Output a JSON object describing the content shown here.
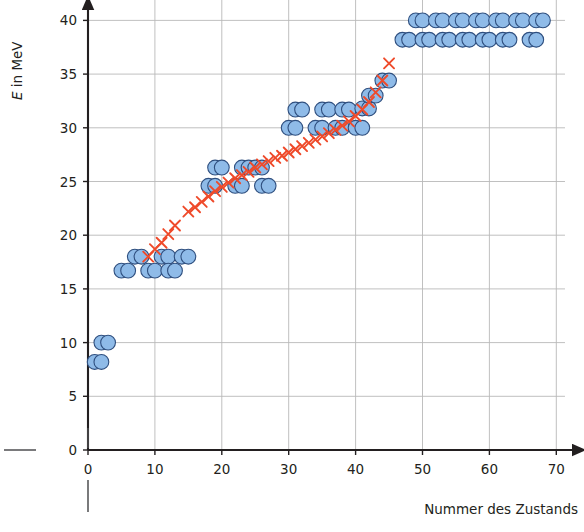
{
  "chart_data": {
    "type": "scatter",
    "title": "",
    "xlabel": "Nummer des Zustands",
    "ylabel": "E in MeV",
    "ylabel_parts": {
      "symbol": "E",
      "rest": " in MeV"
    },
    "xlim": [
      0,
      71
    ],
    "ylim": [
      0,
      41.5
    ],
    "xticks": [
      0,
      10,
      20,
      30,
      40,
      50,
      60,
      70
    ],
    "xtick_labels": [
      "0",
      "10",
      "20",
      "30",
      "40",
      "50",
      "60",
      "70"
    ],
    "yticks": [
      0,
      5,
      10,
      15,
      20,
      25,
      30,
      35,
      40
    ],
    "ytick_labels": [
      "0",
      "5",
      "10",
      "15",
      "20",
      "25",
      "30",
      "35",
      "40"
    ],
    "grid": true,
    "grid_color": "#b9b9b9",
    "axis_color": "#231f20",
    "series": [
      {
        "name": "Zustände",
        "marker": "circle",
        "color": "#8fbbe8",
        "edge_color": "#2f4f7f",
        "points": [
          [
            1,
            8.2
          ],
          [
            2,
            8.2
          ],
          [
            2,
            10.0
          ],
          [
            3,
            10.0
          ],
          [
            5,
            16.7
          ],
          [
            6,
            16.7
          ],
          [
            7,
            18.0
          ],
          [
            8,
            18.0
          ],
          [
            9,
            16.7
          ],
          [
            10,
            16.7
          ],
          [
            11,
            18.0
          ],
          [
            12,
            18.0
          ],
          [
            12,
            16.7
          ],
          [
            13,
            16.7
          ],
          [
            14,
            18.0
          ],
          [
            15,
            18.0
          ],
          [
            18,
            24.6
          ],
          [
            19,
            24.6
          ],
          [
            19,
            26.3
          ],
          [
            20,
            26.3
          ],
          [
            22,
            24.6
          ],
          [
            23,
            24.6
          ],
          [
            23,
            26.3
          ],
          [
            24,
            26.3
          ],
          [
            25,
            26.3
          ],
          [
            26,
            26.3
          ],
          [
            26,
            24.6
          ],
          [
            27,
            24.6
          ],
          [
            30,
            30.0
          ],
          [
            31,
            30.0
          ],
          [
            31,
            31.7
          ],
          [
            32,
            31.7
          ],
          [
            34,
            30.0
          ],
          [
            35,
            30.0
          ],
          [
            35,
            31.7
          ],
          [
            36,
            31.7
          ],
          [
            37,
            30.0
          ],
          [
            38,
            30.0
          ],
          [
            38,
            31.7
          ],
          [
            39,
            31.7
          ],
          [
            40,
            30.0
          ],
          [
            41,
            30.0
          ],
          [
            41,
            31.8
          ],
          [
            42,
            31.8
          ],
          [
            42,
            33.0
          ],
          [
            43,
            33.0
          ],
          [
            44,
            34.4
          ],
          [
            45,
            34.4
          ],
          [
            47,
            38.2
          ],
          [
            48,
            38.2
          ],
          [
            49,
            40.0
          ],
          [
            50,
            40.0
          ],
          [
            50,
            38.2
          ],
          [
            51,
            38.2
          ],
          [
            52,
            40.0
          ],
          [
            53,
            40.0
          ],
          [
            53,
            38.2
          ],
          [
            54,
            38.2
          ],
          [
            55,
            40.0
          ],
          [
            56,
            40.0
          ],
          [
            56,
            38.2
          ],
          [
            57,
            38.2
          ],
          [
            58,
            40.0
          ],
          [
            59,
            40.0
          ],
          [
            59,
            38.2
          ],
          [
            60,
            38.2
          ],
          [
            61,
            40.0
          ],
          [
            62,
            40.0
          ],
          [
            62,
            38.2
          ],
          [
            63,
            38.2
          ],
          [
            64,
            40.0
          ],
          [
            65,
            40.0
          ],
          [
            66,
            38.2
          ],
          [
            67,
            38.2
          ],
          [
            67,
            40.0
          ],
          [
            68,
            40.0
          ]
        ]
      },
      {
        "name": "Trendlinie",
        "marker": "cross",
        "color": "#ef4a2a",
        "points": [
          [
            9,
            18.0
          ],
          [
            10,
            18.7
          ],
          [
            11,
            19.3
          ],
          [
            12,
            20.1
          ],
          [
            13,
            20.9
          ],
          [
            15,
            22.2
          ],
          [
            16,
            22.6
          ],
          [
            17,
            23.1
          ],
          [
            18,
            23.6
          ],
          [
            19,
            24.1
          ],
          [
            20,
            24.5
          ],
          [
            21,
            24.9
          ],
          [
            22,
            25.3
          ],
          [
            23,
            25.6
          ],
          [
            24,
            25.9
          ],
          [
            25,
            26.3
          ],
          [
            26,
            26.6
          ],
          [
            27,
            26.9
          ],
          [
            28,
            27.2
          ],
          [
            29,
            27.4
          ],
          [
            30,
            27.7
          ],
          [
            31,
            28.0
          ],
          [
            32,
            28.3
          ],
          [
            33,
            28.6
          ],
          [
            34,
            28.9
          ],
          [
            35,
            29.2
          ],
          [
            36,
            29.5
          ],
          [
            37,
            29.8
          ],
          [
            38,
            30.2
          ],
          [
            39,
            30.6
          ],
          [
            40,
            31.1
          ],
          [
            41,
            31.7
          ],
          [
            42,
            32.4
          ],
          [
            43,
            33.3
          ],
          [
            44,
            34.4
          ],
          [
            45,
            36.0
          ]
        ]
      }
    ]
  }
}
